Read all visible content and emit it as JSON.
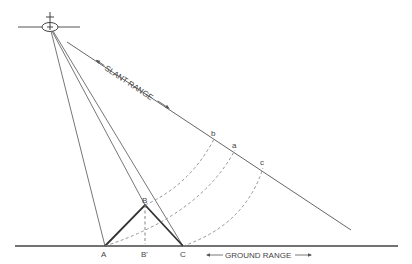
{
  "diagram": {
    "labels": {
      "slant_range": "SLANT RANGE",
      "ground_range": "GROUND RANGE",
      "point_A": "A",
      "point_B": "B",
      "point_B_prime": "B'",
      "point_C": "C",
      "point_a": "a",
      "point_b": "b",
      "point_c": "c"
    },
    "colors": {
      "line": "#555555",
      "terrain": "#333333",
      "dashed": "#777777"
    }
  }
}
